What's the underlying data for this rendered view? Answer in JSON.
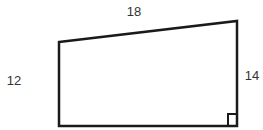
{
  "diagram": {
    "shape": "right trapezoid",
    "labels": {
      "top": "18",
      "left": "12",
      "right": "14"
    },
    "right_angle_marker": "bottom-right",
    "colors": {
      "stroke": "#1a1a1a",
      "text": "#333333"
    }
  }
}
